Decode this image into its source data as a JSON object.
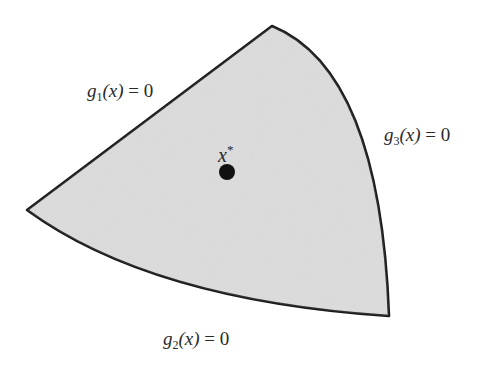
{
  "figure": {
    "region": {
      "fill": "#d9d9d9",
      "stroke": "#1a1a1a",
      "vertices": {
        "left": [
          27,
          210
        ],
        "top": [
          272,
          26
        ],
        "bottom_right": [
          389,
          316
        ]
      }
    },
    "constraints": [
      {
        "name": "g",
        "index": "1",
        "arg": "(x)",
        "rhs": "= 0",
        "label": "g1(x) = 0"
      },
      {
        "name": "g",
        "index": "2",
        "arg": "(x)",
        "rhs": "= 0",
        "label": "g2(x) = 0"
      },
      {
        "name": "g",
        "index": "3",
        "arg": "(x)",
        "rhs": "= 0",
        "label": "g3(x) = 0"
      }
    ],
    "optimum": {
      "symbol": "x",
      "superscript": "*",
      "point": [
        227,
        172
      ],
      "color": "#111111"
    }
  }
}
